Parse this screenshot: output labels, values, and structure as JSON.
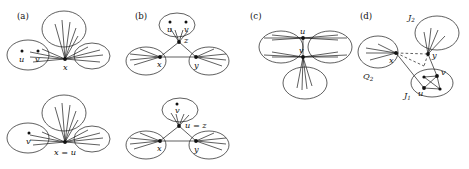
{
  "figure": {
    "background_color": "#ffffff",
    "stroke_color": "#1a1a1a",
    "node_color": "#111111"
  },
  "panels": [
    {
      "id": "a",
      "label": "(a)",
      "subfigures": [
        {
          "id": "a-top",
          "center_node": "x",
          "blob_dots": [
            "u",
            "v"
          ]
        },
        {
          "id": "a-bottom",
          "center_node": "x = u",
          "blob_dots": [
            "v"
          ]
        }
      ]
    },
    {
      "id": "b",
      "label": "(b)",
      "subfigures": [
        {
          "id": "b-top",
          "apex_node": "z",
          "left_node": "x",
          "right_node": "y",
          "blob_dots": [
            "u",
            "v"
          ]
        },
        {
          "id": "b-bottom",
          "apex_node": "u = z",
          "left_node": "x",
          "right_node": "y",
          "blob_dots": [
            "v"
          ]
        }
      ]
    },
    {
      "id": "c",
      "label": "(c)",
      "subfigures": [
        {
          "id": "c-main",
          "top_node": "u",
          "bottom_node": "v"
        }
      ]
    },
    {
      "id": "d",
      "label": "(d)",
      "subfigures": [
        {
          "id": "d-main",
          "blob_labels": [
            "J",
            "J",
            "Q"
          ],
          "blob_label_top": "J",
          "blob_label_top_sub": "2",
          "blob_label_bottom": "J",
          "blob_label_bottom_sub": "1",
          "blob_label_left": "Q",
          "blob_label_left_sub": "2",
          "nodes": [
            "x",
            "y",
            "u",
            "v"
          ]
        }
      ]
    }
  ],
  "labels": {
    "panel_a": "(a)",
    "panel_b": "(b)",
    "panel_c": "(c)",
    "panel_d": "(d)",
    "a_top_x": "x",
    "a_top_u": "u",
    "a_top_v": "v",
    "a_bot_xu": "x = u",
    "a_bot_v": "v",
    "b_top_z": "z",
    "b_top_x": "x",
    "b_top_y": "y",
    "b_top_u": "u",
    "b_top_v": "v",
    "b_bot_uz": "u = z",
    "b_bot_x": "x",
    "b_bot_y": "y",
    "b_bot_v": "v",
    "c_u": "u",
    "c_v": "v",
    "d_J2": "J",
    "d_J2_sub": "2",
    "d_J1": "J",
    "d_J1_sub": "1",
    "d_Q2": "Q",
    "d_Q2_sub": "2",
    "d_x": "x",
    "d_y": "y",
    "d_u": "u",
    "d_v": "v"
  }
}
